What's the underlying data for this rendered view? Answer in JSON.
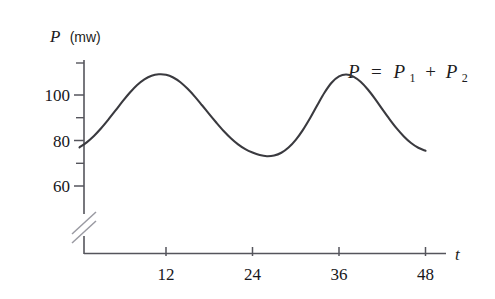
{
  "figure": {
    "background_color": "#ffffff",
    "curve_color": "#3a3a3f",
    "axis_color": "#55555c",
    "text_color": "#17171b"
  },
  "axes": {
    "y": {
      "title_symbol": "P",
      "title_unit": "(mw)",
      "tick_labels": [
        "100",
        "80",
        "60"
      ],
      "tick_values": [
        100,
        80,
        60
      ],
      "minor_ticks": [
        110,
        90,
        70
      ],
      "has_break": true,
      "break_symbol": "//"
    },
    "x": {
      "title_symbol": "t",
      "tick_labels": [
        "12",
        "24",
        "36",
        "48"
      ],
      "tick_values": [
        12,
        24,
        36,
        48
      ]
    }
  },
  "annotations": {
    "equation": {
      "lhs": "P",
      "equals": "=",
      "term1_base": "P",
      "term1_sub": "1",
      "plus": "+",
      "term2_base": "P",
      "term2_sub": "2"
    }
  },
  "chart_data": {
    "type": "line",
    "title": "",
    "xlabel": "t",
    "ylabel": "P (mw)",
    "xlim": [
      0,
      52
    ],
    "ylim": [
      55,
      113
    ],
    "grid": false,
    "legend": "none",
    "axis_break_y": true,
    "x_ticks": [
      12,
      24,
      36,
      48
    ],
    "y_ticks": [
      60,
      80,
      100
    ],
    "y_minor_ticks": [
      70,
      90,
      110
    ],
    "annotation_text": "P = P1 + P2",
    "series": [
      {
        "name": "P = P1 + P2",
        "color": "#3a3a3f",
        "x": [
          0,
          1,
          2,
          3,
          4,
          5,
          6,
          7,
          8,
          9,
          10,
          11,
          12,
          13,
          14,
          15,
          16,
          17,
          18,
          19,
          20,
          21,
          22,
          23,
          24,
          25,
          26,
          27,
          28,
          29,
          30,
          31,
          32,
          33,
          34,
          35,
          36,
          37,
          38,
          39,
          40,
          41,
          42,
          43,
          44,
          45,
          46,
          47,
          48
        ],
        "y": [
          77.0,
          79.2,
          82.0,
          85.4,
          89.2,
          93.2,
          97.3,
          101.1,
          104.4,
          106.9,
          108.5,
          109.1,
          108.9,
          107.7,
          105.6,
          102.7,
          99.3,
          95.5,
          91.6,
          87.8,
          84.2,
          81.0,
          78.3,
          76.2,
          74.7,
          73.6,
          73.1,
          73.4,
          74.6,
          76.9,
          80.3,
          84.7,
          89.9,
          95.6,
          101.1,
          105.5,
          108.2,
          109.0,
          108.1,
          105.8,
          102.4,
          98.3,
          93.8,
          89.4,
          85.3,
          81.8,
          78.9,
          76.8,
          75.5
        ]
      }
    ]
  }
}
